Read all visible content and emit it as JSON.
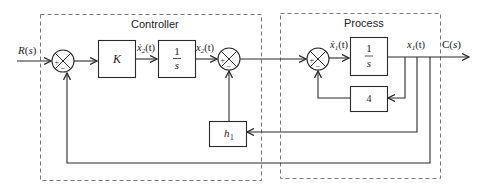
{
  "diagram": {
    "type": "control-system-block-diagram",
    "groups": [
      {
        "id": "controller",
        "title": "Controller"
      },
      {
        "id": "process",
        "title": "Process"
      }
    ],
    "input": {
      "label": "R(s)"
    },
    "output": {
      "label": "C(s)"
    },
    "blocks": [
      {
        "id": "K",
        "label": "K"
      },
      {
        "id": "int1",
        "numerator": "1",
        "denominator": "s"
      },
      {
        "id": "int2",
        "numerator": "1",
        "denominator": "s"
      },
      {
        "id": "gain4",
        "label": "4"
      },
      {
        "id": "h1",
        "label": "h",
        "subscript": "1"
      }
    ],
    "signals": {
      "x2dot": {
        "base": "ẋ",
        "sub": "2",
        "arg": "(t)"
      },
      "x2": {
        "base": "x",
        "sub": "2",
        "arg": "(t)"
      },
      "x1dot": {
        "base": "ẋ",
        "sub": "1",
        "arg": "(t)"
      },
      "x1": {
        "base": "x",
        "sub": "1",
        "arg": "(t)"
      }
    },
    "summing_junctions": [
      {
        "id": "sum1",
        "plus": "+",
        "minus": "−"
      },
      {
        "id": "sum2",
        "plus": "+",
        "minus": "−"
      },
      {
        "id": "sum3",
        "plus": "+",
        "minus": "−"
      }
    ],
    "colors": {
      "line": "#2b2b2b",
      "dashed_border": "#777777",
      "background": "#ffffff"
    }
  }
}
